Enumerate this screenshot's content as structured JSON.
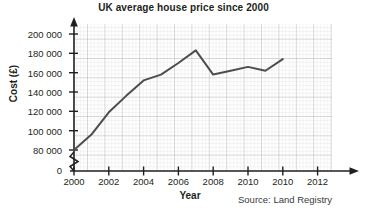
{
  "chart_data": {
    "type": "line",
    "title": "UK average house price since 2000",
    "xlabel": "Year",
    "ylabel": "Cost (£)",
    "source": "Source: Land Registry",
    "grid": true,
    "legend": false,
    "xlim": [
      2000,
      2012.6
    ],
    "ylim": [
      74000,
      208000
    ],
    "y_axis_break": true,
    "y_break_label": "0",
    "xticks": [
      2000,
      2002,
      2004,
      2006,
      2008,
      2010,
      2012,
      2014
    ],
    "xtick_labels": [
      "2000",
      "2002",
      "2004",
      "2006",
      "2008",
      "2010",
      "2010",
      "2012"
    ],
    "yticks": [
      80000,
      100000,
      120000,
      140000,
      160000,
      180000,
      200000
    ],
    "ytick_labels": [
      "80 000",
      "100 000",
      "120 000",
      "140 000",
      "160 000",
      "180 000",
      "200 000"
    ],
    "x": [
      2000,
      2001,
      2002,
      2003,
      2004,
      2005,
      2006,
      2007,
      2008,
      2009,
      2010,
      2011,
      2012
    ],
    "values": [
      80000,
      96000,
      119000,
      136000,
      152000,
      158000,
      170000,
      183000,
      158000,
      162000,
      166000,
      162000,
      174000
    ],
    "series": [
      {
        "name": "UK average house price",
        "color": "#4d4d4d",
        "values": [
          80000,
          96000,
          119000,
          136000,
          152000,
          158000,
          170000,
          183000,
          158000,
          162000,
          166000,
          162000,
          174000
        ]
      }
    ]
  }
}
